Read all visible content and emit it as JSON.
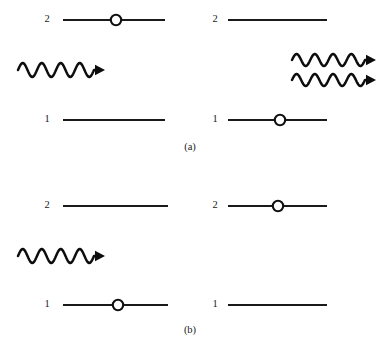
{
  "figure": {
    "background_color": "#ffffff",
    "ink_color": "#1a1a1a",
    "panels": [
      {
        "id": "panel-a",
        "caption": "(a)",
        "caption_x": 190,
        "caption_y": 148,
        "process": "stimulated emission",
        "sides": [
          {
            "id": "panel-a-before",
            "levels": [
              {
                "label": "2",
                "label_x": 47,
                "label_y": 20,
                "line_x1": 63,
                "line_x2": 165,
                "line_y": 20,
                "electron": true,
                "electron_x": 116
              },
              {
                "label": "1",
                "label_x": 47,
                "label_y": 120,
                "line_x1": 63,
                "line_x2": 165,
                "line_y": 120,
                "electron": false,
                "electron_x": 116
              }
            ],
            "photons": [
              {
                "x_start": 18,
                "x_end": 105,
                "y": 70,
                "cycles": 4,
                "amplitude": 7
              }
            ]
          },
          {
            "id": "panel-a-after",
            "levels": [
              {
                "label": "2",
                "label_x": 215,
                "label_y": 20,
                "line_x1": 228,
                "line_x2": 327,
                "line_y": 20,
                "electron": false,
                "electron_x": 278
              },
              {
                "label": "1",
                "label_x": 215,
                "label_y": 120,
                "line_x1": 228,
                "line_x2": 327,
                "line_y": 120,
                "electron": true,
                "electron_x": 280
              }
            ],
            "photons": [
              {
                "x_start": 292,
                "x_end": 376,
                "y": 60,
                "cycles": 4,
                "amplitude": 6
              },
              {
                "x_start": 292,
                "x_end": 376,
                "y": 80,
                "cycles": 4,
                "amplitude": 6
              }
            ]
          }
        ]
      },
      {
        "id": "panel-b",
        "caption": "(b)",
        "caption_x": 190,
        "caption_y": 331,
        "process": "absorption",
        "sides": [
          {
            "id": "panel-b-before",
            "levels": [
              {
                "label": "2",
                "label_x": 47,
                "label_y": 206,
                "line_x1": 63,
                "line_x2": 168,
                "line_y": 206,
                "electron": false,
                "electron_x": 116
              },
              {
                "label": "1",
                "label_x": 47,
                "label_y": 305,
                "line_x1": 63,
                "line_x2": 168,
                "line_y": 305,
                "electron": true,
                "electron_x": 118
              }
            ],
            "photons": [
              {
                "x_start": 18,
                "x_end": 105,
                "y": 256,
                "cycles": 4,
                "amplitude": 7
              }
            ]
          },
          {
            "id": "panel-b-after",
            "levels": [
              {
                "label": "2",
                "label_x": 215,
                "label_y": 206,
                "line_x1": 228,
                "line_x2": 327,
                "line_y": 206,
                "electron": true,
                "electron_x": 278
              },
              {
                "label": "1",
                "label_x": 215,
                "label_y": 305,
                "line_x1": 228,
                "line_x2": 327,
                "line_y": 305,
                "electron": false,
                "electron_x": 278
              }
            ],
            "photons": []
          }
        ]
      }
    ]
  }
}
